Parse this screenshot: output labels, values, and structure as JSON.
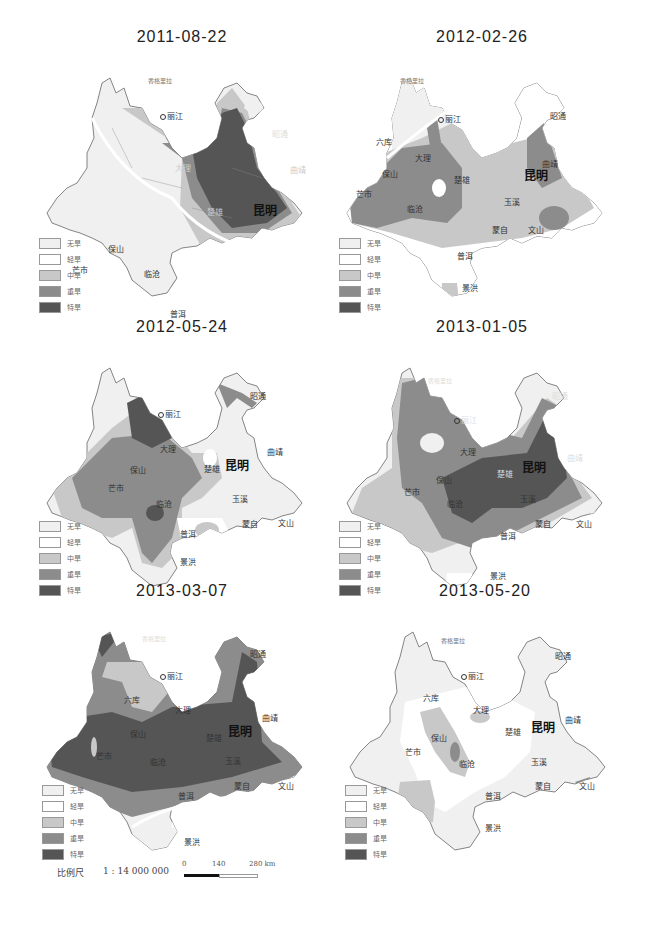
{
  "legend": {
    "items": [
      {
        "label": "无旱",
        "level": "none",
        "color": "#f0f0f0"
      },
      {
        "label": "轻旱",
        "level": "light",
        "color": "#ffffff"
      },
      {
        "label": "中旱",
        "level": "moderate",
        "color": "#c8c8c8"
      },
      {
        "label": "重旱",
        "level": "severe",
        "color": "#8c8c8c"
      },
      {
        "label": "特旱",
        "level": "extreme",
        "color": "#555555"
      }
    ]
  },
  "panels": [
    {
      "title": "2011-08-22",
      "capital": "昆明"
    },
    {
      "title": "2012-02-26",
      "capital": "昆明"
    },
    {
      "title": "2012-05-24",
      "capital": "昆明"
    },
    {
      "title": "2013-01-05",
      "capital": "昆明"
    },
    {
      "title": "2013-03-07",
      "capital": "昆明"
    },
    {
      "title": "2013-05-20",
      "capital": "昆明"
    }
  ],
  "cities": {
    "kunming": "昆明",
    "lijiang": "丽江",
    "dali": "大理",
    "baoshan": "保山",
    "mangshi": "芒市",
    "lincang": "临沧",
    "puer": "普洱",
    "jinghong": "景洪",
    "chuxiong": "楚雄",
    "yuxi": "玉溪",
    "qujing": "曲靖",
    "zhaotong": "昭通",
    "mengzi": "蒙自",
    "wenshan": "文山",
    "shangri_la": "香格里拉",
    "liuku": "六库"
  },
  "scale": {
    "label": "比例尺",
    "ratio": "1 : 14 000 000",
    "ticks": [
      "0",
      "140",
      "280 km"
    ]
  }
}
